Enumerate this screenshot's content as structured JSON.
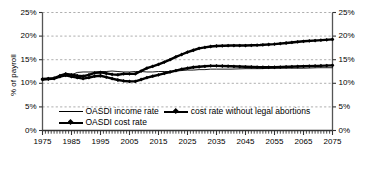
{
  "chart_data": {
    "type": "line",
    "title": "",
    "xlabel": "",
    "ylabel": "% of payroll",
    "xlim": [
      1975,
      2075
    ],
    "ylim": [
      0,
      25
    ],
    "ytick_labels": [
      "0%",
      "5%",
      "10%",
      "15%",
      "20%",
      "25%"
    ],
    "ytick_values": [
      0,
      5,
      10,
      15,
      20,
      25
    ],
    "xtick_labels": [
      "1975",
      "1985",
      "1995",
      "2005",
      "2015",
      "2025",
      "2035",
      "2045",
      "2055",
      "2065",
      "2075"
    ],
    "xtick_values": [
      1975,
      1985,
      1995,
      2005,
      2015,
      2025,
      2035,
      2045,
      2055,
      2065,
      2075
    ],
    "minor_xtick_interval": 1,
    "grid": "horizontal-dashed",
    "dual_y_axis": true,
    "legend_position": "inside-bottom-left",
    "series": [
      {
        "name": "OASDI income rate",
        "style": "thin-solid",
        "marker": "none",
        "color": "#000000",
        "x": [
          1975,
          1977,
          1979,
          1981,
          1983,
          1985,
          1987,
          1989,
          1991,
          1993,
          1995,
          1997,
          1999,
          2001,
          2003,
          2005,
          2007,
          2009,
          2011,
          2013,
          2015,
          2017,
          2019,
          2021,
          2023,
          2025,
          2027,
          2029,
          2031,
          2033,
          2035,
          2040,
          2045,
          2050,
          2055,
          2060,
          2065,
          2070,
          2075
        ],
        "values": [
          10.9,
          10.9,
          11.1,
          11.5,
          11.6,
          11.8,
          12.3,
          12.4,
          12.4,
          12.4,
          12.5,
          12.5,
          12.6,
          12.5,
          12.4,
          12.4,
          12.5,
          12.5,
          12.4,
          12.4,
          12.5,
          12.5,
          12.5,
          12.6,
          12.7,
          12.8,
          12.8,
          12.9,
          12.9,
          13.0,
          13.0,
          13.0,
          13.1,
          13.1,
          13.2,
          13.2,
          13.2,
          13.3,
          13.3
        ]
      },
      {
        "name": "cost rate without legal abortions",
        "style": "thick-marker",
        "marker": "diamond",
        "color": "#000000",
        "x": [
          1975,
          1977,
          1979,
          1981,
          1983,
          1985,
          1987,
          1989,
          1991,
          1993,
          1995,
          1997,
          1999,
          2001,
          2003,
          2005,
          2007,
          2009,
          2011,
          2013,
          2015,
          2017,
          2019,
          2021,
          2023,
          2025,
          2027,
          2029,
          2031,
          2033,
          2035,
          2040,
          2045,
          2050,
          2055,
          2060,
          2065,
          2070,
          2075
        ],
        "values": [
          10.9,
          11.0,
          11.1,
          11.6,
          12.0,
          11.8,
          11.6,
          11.5,
          11.8,
          12.2,
          12.3,
          12.1,
          11.9,
          11.8,
          12.0,
          12.0,
          12.0,
          12.6,
          13.2,
          13.6,
          14.0,
          14.5,
          15.0,
          15.6,
          16.1,
          16.6,
          17.0,
          17.4,
          17.6,
          17.8,
          17.9,
          18.0,
          18.0,
          18.1,
          18.3,
          18.6,
          18.9,
          19.1,
          19.3
        ]
      },
      {
        "name": "OASDI cost rate",
        "style": "thick-marker",
        "marker": "diamond",
        "color": "#000000",
        "x": [
          1975,
          1977,
          1979,
          1981,
          1983,
          1985,
          1987,
          1989,
          1991,
          1993,
          1995,
          1997,
          1999,
          2001,
          2003,
          2005,
          2007,
          2009,
          2011,
          2013,
          2015,
          2017,
          2019,
          2021,
          2023,
          2025,
          2027,
          2029,
          2031,
          2033,
          2035,
          2040,
          2045,
          2050,
          2055,
          2060,
          2065,
          2070,
          2075
        ],
        "values": [
          10.8,
          10.9,
          11.0,
          11.4,
          11.7,
          11.4,
          11.2,
          11.0,
          11.2,
          11.5,
          11.6,
          11.3,
          11.0,
          10.7,
          10.5,
          10.4,
          10.4,
          10.8,
          11.2,
          11.5,
          11.8,
          12.1,
          12.4,
          12.7,
          13.0,
          13.2,
          13.4,
          13.5,
          13.6,
          13.7,
          13.7,
          13.6,
          13.5,
          13.4,
          13.4,
          13.5,
          13.6,
          13.7,
          13.8
        ]
      }
    ]
  },
  "legend": {
    "rows": [
      [
        "OASDI income rate",
        "cost rate without legal abortions"
      ],
      [
        "OASDI cost rate"
      ]
    ]
  },
  "axis_title": {
    "y": "% of payroll"
  }
}
